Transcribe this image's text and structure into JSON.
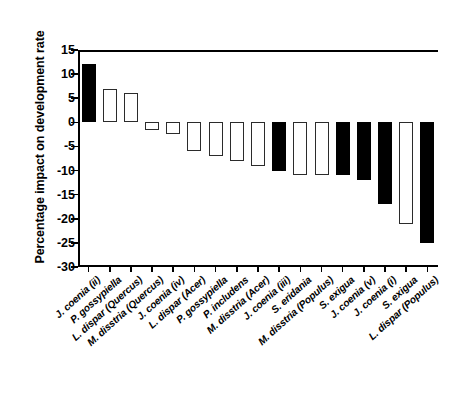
{
  "chart_data": {
    "type": "bar",
    "title": "",
    "xlabel": "",
    "ylabel": "Percentage impact on development rate",
    "ylim": [
      -30,
      15
    ],
    "ytick_values": [
      15,
      10,
      5,
      0,
      -5,
      -10,
      -15,
      -20,
      -25,
      -30
    ],
    "ytick_labels": [
      "15",
      "10",
      "5",
      "0",
      "-5",
      "-10",
      "-15",
      "-20",
      "-25",
      "-30"
    ],
    "grid": false,
    "legend": "none",
    "bar_fill_styles": {
      "filled": "#000000",
      "open": "#ffffff",
      "outline": "#000000"
    },
    "categories": [
      "J. coenia (ii)",
      "P. gossypiella",
      "L. dispar (Quercus)",
      "M. disstria (Quercus)",
      "J. coenia (iv)",
      "L. dispar (Acer)",
      "P. gossypiella",
      "P. includens",
      "M. disstria (Acer)",
      "J. coenia (iii)",
      "S. eridania",
      "M. disstria (Populus)",
      "S. exigua",
      "J. coenia (v)",
      "J. coenia (i)",
      "S. exigua",
      "L. dispar (Populus)"
    ],
    "values": [
      12,
      7,
      6,
      -1.5,
      -2.5,
      -6,
      -7,
      -8,
      -9,
      -10,
      -11,
      -11,
      -11,
      -12,
      -17,
      -21,
      -25
    ],
    "fills": [
      "filled",
      "open",
      "open",
      "open",
      "open",
      "open",
      "open",
      "open",
      "open",
      "filled",
      "open",
      "open",
      "filled",
      "filled",
      "filled",
      "open",
      "filled"
    ]
  }
}
